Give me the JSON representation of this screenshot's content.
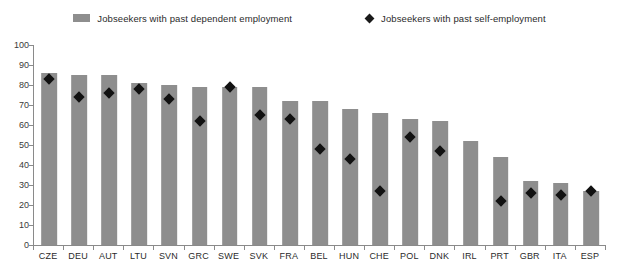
{
  "chart_data": {
    "type": "bar",
    "title": "",
    "subtitle": "",
    "xlabel": "",
    "ylabel": "",
    "ylim": [
      0,
      100
    ],
    "ytick_step": 10,
    "yticks": [
      0,
      10,
      20,
      30,
      40,
      50,
      60,
      70,
      80,
      90,
      100
    ],
    "grid": false,
    "legend_position": "top-center",
    "categories": [
      "CZE",
      "DEU",
      "AUT",
      "LTU",
      "SVN",
      "GRC",
      "SWE",
      "SVK",
      "FRA",
      "BEL",
      "HUN",
      "CHE",
      "POL",
      "DNK",
      "IRL",
      "PRT",
      "GBR",
      "ITA",
      "ESP"
    ],
    "series": [
      {
        "name": "Jobseekers with past dependent employment",
        "kind": "bar",
        "color": "#8e8e8e",
        "values": [
          86,
          85,
          85,
          81,
          80,
          79,
          79,
          79,
          72,
          72,
          68,
          66,
          63,
          62,
          52,
          44,
          32,
          31,
          27
        ]
      },
      {
        "name": "Jobseekers with past self-employment",
        "kind": "marker",
        "marker": "diamond",
        "color": "#111111",
        "values": [
          83,
          74,
          76,
          78,
          73,
          62,
          79,
          65,
          63,
          48,
          43,
          27,
          54,
          47,
          null,
          22,
          26,
          25,
          27
        ]
      }
    ]
  },
  "legend": {
    "entries": [
      {
        "label": "Jobseekers with past dependent employment",
        "swatch": "bar-swatch-icon",
        "color": "#8e8e8e"
      },
      {
        "label": "Jobseekers with past self-employment",
        "swatch": "diamond-marker-icon",
        "color": "#111111"
      }
    ]
  },
  "axes": {
    "y": {
      "tick_labels": [
        "100",
        "90",
        "80",
        "70",
        "60",
        "50",
        "40",
        "30",
        "20",
        "10",
        "0"
      ],
      "min": 0,
      "max": 100
    },
    "x": {
      "tick_labels": [
        "CZE",
        "DEU",
        "AUT",
        "LTU",
        "SVN",
        "GRC",
        "SWE",
        "SVK",
        "FRA",
        "BEL",
        "HUN",
        "CHE",
        "POL",
        "DNK",
        "IRL",
        "PRT",
        "GBR",
        "ITA",
        "ESP"
      ]
    }
  },
  "colors": {
    "bar": "#8e8e8e",
    "marker": "#111111",
    "axis": "#8a8a8a",
    "text": "#2b2b2b",
    "background": "#ffffff"
  }
}
